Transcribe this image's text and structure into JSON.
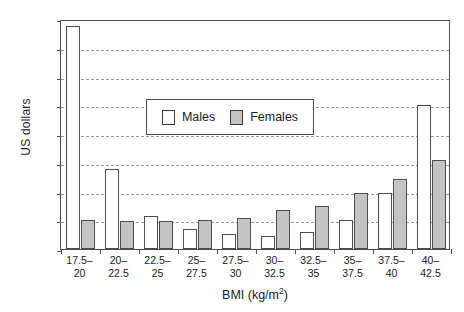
{
  "chart_data": {
    "type": "bar",
    "title": "",
    "xlabel": "BMI (kg/m2)",
    "xlabel_base": "BMI (kg/m",
    "xlabel_sup": "2",
    "xlabel_tail": ")",
    "ylabel": "US dollars",
    "ylim": [
      0,
      16000
    ],
    "ytick_step": 2000,
    "yticks": [
      0,
      2000,
      4000,
      6000,
      8000,
      10000,
      12000,
      14000,
      16000
    ],
    "ytick_labels": [
      "0",
      "2000",
      "4000",
      "6000",
      "8000",
      "10000",
      "12000",
      "14000",
      "16000"
    ],
    "grid": true,
    "grid_style": "dashed-horizontal",
    "legend_position": "upper-center",
    "categories": [
      "17.5-20",
      "20-22.5",
      "22.5-25",
      "25-27.5",
      "27.5-30",
      "30-32.5",
      "32.5-35",
      "35-37.5",
      "37.5-40",
      "40-42.5"
    ],
    "category_lines": [
      {
        "line1": "17.5–",
        "line2": "20"
      },
      {
        "line1": "20–",
        "line2": "22.5"
      },
      {
        "line1": "22.5–",
        "line2": "25"
      },
      {
        "line1": "25–",
        "line2": "27.5"
      },
      {
        "line1": "27.5–",
        "line2": "30"
      },
      {
        "line1": "30–",
        "line2": "32.5"
      },
      {
        "line1": "32.5–",
        "line2": "35"
      },
      {
        "line1": "35–",
        "line2": "37.5"
      },
      {
        "line1": "37.5–",
        "line2": "40"
      },
      {
        "line1": "40–",
        "line2": "42.5"
      }
    ],
    "series": [
      {
        "name": "Males",
        "color": "#ffffff",
        "edge_color": "#4d4d4d",
        "values": [
          15500,
          5600,
          2300,
          1400,
          1050,
          900,
          1150,
          2000,
          3900,
          10000
        ]
      },
      {
        "name": "Females",
        "color": "#c4c4c4",
        "edge_color": "#4d4d4d",
        "values": [
          2000,
          1950,
          1950,
          2000,
          2150,
          2700,
          3000,
          3900,
          4900,
          6200
        ]
      }
    ]
  },
  "legend": {
    "items": [
      {
        "label": "Males",
        "swatch": "male"
      },
      {
        "label": "Females",
        "swatch": "female"
      }
    ]
  }
}
